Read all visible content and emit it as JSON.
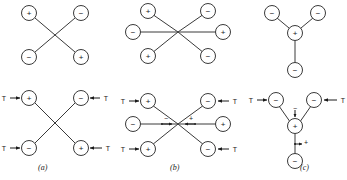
{
  "figure": {
    "captions": [
      {
        "id": "a",
        "label": "(a)"
      },
      {
        "id": "b",
        "label": "(b)"
      },
      {
        "id": "c",
        "label": "(c)"
      }
    ],
    "signs": {
      "plus": "+",
      "minus": "−"
    },
    "tension_label": "T",
    "panels": [
      {
        "id": "top-left",
        "name": "cross-four-charge-unloaded",
        "shape": "X",
        "nodes": [
          {
            "pos": "top-left",
            "sign": "+"
          },
          {
            "pos": "top-right",
            "sign": "−"
          },
          {
            "pos": "bottom-left",
            "sign": "−"
          },
          {
            "pos": "bottom-right",
            "sign": "+"
          }
        ],
        "forces": []
      },
      {
        "id": "top-middle",
        "name": "six-spoke-charge-unloaded",
        "shape": "star-6",
        "nodes": [
          {
            "pos": "upper-left",
            "sign": "+"
          },
          {
            "pos": "upper-right",
            "sign": "−"
          },
          {
            "pos": "left",
            "sign": "−"
          },
          {
            "pos": "right",
            "sign": "+"
          },
          {
            "pos": "lower-left",
            "sign": "+"
          },
          {
            "pos": "lower-right",
            "sign": "−"
          }
        ],
        "forces": []
      },
      {
        "id": "top-right",
        "name": "y-junction-charge-unloaded",
        "shape": "Y",
        "nodes": [
          {
            "pos": "upper-left",
            "sign": "−"
          },
          {
            "pos": "upper-right",
            "sign": "−"
          },
          {
            "pos": "center",
            "sign": "+"
          },
          {
            "pos": "bottom",
            "sign": "−"
          }
        ],
        "forces": []
      },
      {
        "id": "bottom-left",
        "name": "cross-four-charge-loaded",
        "shape": "X",
        "caption": "(a)",
        "nodes": [
          {
            "pos": "top-left",
            "sign": "+"
          },
          {
            "pos": "top-right",
            "sign": "−"
          },
          {
            "pos": "bottom-left",
            "sign": "−"
          },
          {
            "pos": "bottom-right",
            "sign": "+"
          }
        ],
        "forces": [
          {
            "at": "top-left",
            "label": "T",
            "direction": "right"
          },
          {
            "at": "top-right",
            "label": "T",
            "direction": "left"
          },
          {
            "at": "bottom-left",
            "label": "T",
            "direction": "right"
          },
          {
            "at": "bottom-right",
            "label": "T",
            "direction": "left"
          }
        ]
      },
      {
        "id": "bottom-middle",
        "name": "six-spoke-charge-loaded",
        "shape": "star-6",
        "caption": "(b)",
        "nodes": [
          {
            "pos": "upper-left",
            "sign": "+"
          },
          {
            "pos": "upper-right",
            "sign": "−"
          },
          {
            "pos": "left",
            "sign": "−"
          },
          {
            "pos": "right",
            "sign": "+"
          },
          {
            "pos": "lower-left",
            "sign": "+"
          },
          {
            "pos": "lower-right",
            "sign": "−"
          }
        ],
        "forces": [
          {
            "at": "upper-left",
            "label": "T",
            "direction": "right"
          },
          {
            "at": "upper-right",
            "label": "T",
            "direction": "left"
          },
          {
            "at": "lower-left",
            "label": "T",
            "direction": "right"
          },
          {
            "at": "lower-right",
            "label": "T",
            "direction": "left"
          }
        ],
        "inner_signs": [
          {
            "pos": "center-left",
            "sign": "−"
          },
          {
            "pos": "center-right",
            "sign": "+"
          }
        ]
      },
      {
        "id": "bottom-right",
        "name": "y-junction-charge-loaded",
        "shape": "Y",
        "caption": "(c)",
        "nodes": [
          {
            "pos": "upper-left",
            "sign": "−"
          },
          {
            "pos": "upper-right",
            "sign": "−"
          },
          {
            "pos": "center",
            "sign": "+"
          },
          {
            "pos": "bottom",
            "sign": "−"
          }
        ],
        "forces": [
          {
            "at": "upper-left",
            "label": "T",
            "direction": "right"
          },
          {
            "at": "upper-right",
            "label": "T",
            "direction": "left"
          }
        ],
        "inner_signs": [
          {
            "pos": "above-center",
            "sign": "−"
          },
          {
            "pos": "below-center-stem",
            "sign": "+"
          }
        ]
      }
    ]
  },
  "colors": {
    "background": "#ffffff",
    "stroke": "#3a3a3a",
    "ink": "#1a1a1a"
  }
}
